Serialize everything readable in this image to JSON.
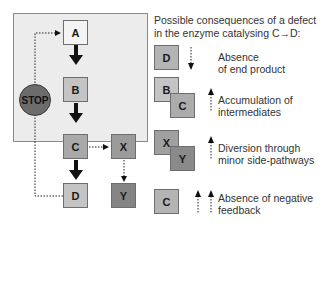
{
  "header": {
    "line1": "Possible consequences of a defect",
    "line2": "in the enzyme catalysing C→D:"
  },
  "pathway": {
    "nodes": [
      {
        "id": "A",
        "label": "A",
        "color": "#f4f4f4"
      },
      {
        "id": "B",
        "label": "B",
        "color": "#c4c4c4"
      },
      {
        "id": "C",
        "label": "C",
        "color": "#a9a9a9"
      },
      {
        "id": "D",
        "label": "D",
        "color": "#c4c4c4"
      },
      {
        "id": "X",
        "label": "X",
        "color": "#9b9b9b"
      },
      {
        "id": "Y",
        "label": "Y",
        "color": "#848484"
      }
    ],
    "stop": {
      "label": "STOP",
      "color": "#6c6c6c"
    }
  },
  "consequences": [
    {
      "boxes": [
        "D"
      ],
      "arrow": "down",
      "line1": "Absence",
      "line2": "of end product"
    },
    {
      "boxes": [
        "B",
        "C"
      ],
      "arrow": "up",
      "line1": "Accumulation of",
      "line2": "intermediates"
    },
    {
      "boxes": [
        "X",
        "Y"
      ],
      "arrow": "up",
      "line1": "Diversion through",
      "line2": "minor side-pathways"
    },
    {
      "boxes": [
        "C"
      ],
      "arrow": "up-double",
      "line1": "Absence of negative",
      "line2": "feedback"
    }
  ]
}
